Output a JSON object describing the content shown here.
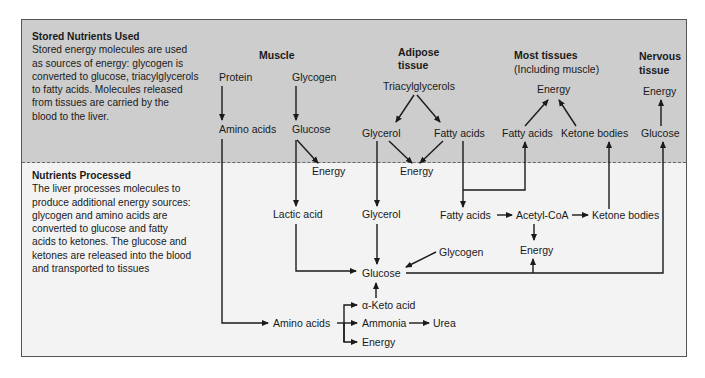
{
  "top_section": {
    "title": "Stored Nutrients Used",
    "lines": [
      "Stored energy molecules are used",
      "as sources of energy: glycogen is",
      "converted to glucose, triacylglycerols",
      "to fatty acids. Molecules released",
      "from tissues are carried by the",
      "blood to the liver."
    ]
  },
  "bottom_section": {
    "title": "Nutrients Processed",
    "lines": [
      "The liver processes molecules to",
      "produce additional energy sources:",
      "glycogen and amino acids are",
      "converted to glucose and fatty",
      "acids to ketones. The glucose and",
      "ketones are released into the blood",
      "and transported to tissues"
    ]
  },
  "tissues": {
    "muscle": "Muscle",
    "adipose": [
      "Adipose",
      "tissue"
    ],
    "most": [
      "Most tissues",
      "(Including muscle)"
    ],
    "nervous": [
      "Nervous",
      "tissue"
    ]
  },
  "nodes": {
    "protein": "Protein",
    "glycogen_muscle": "Glycogen",
    "amino_acids_muscle": "Amino acids",
    "glucose_muscle": "Glucose",
    "energy_muscle": "Energy",
    "triacylglycerols": "Triacylglycerols",
    "glycerol_adipose": "Glycerol",
    "fatty_acids_adipose": "Fatty acids",
    "energy_adipose": "Energy",
    "energy_most": "Energy",
    "fatty_acids_most": "Fatty acids",
    "ketone_bodies_most": "Ketone bodies",
    "energy_nervous": "Energy",
    "glucose_nervous": "Glucose",
    "lactic_acid": "Lactic acid",
    "glycerol_liver": "Glycerol",
    "fatty_acids_liver": "Fatty acids",
    "acetyl_coa": "Acetyl-CoA",
    "ketone_bodies_liver": "Ketone bodies",
    "glycogen_liver": "Glycogen",
    "energy_liver_acetyl": "Energy",
    "glucose_liver": "Glucose",
    "alpha_keto_acid": "α-Keto acid",
    "amino_acids_liver": "Amino acids",
    "ammonia": "Ammonia",
    "urea": "Urea",
    "energy_liver_amino": "Energy"
  },
  "colors": {
    "top_bg": "#cdcdcd",
    "bottom_bg": "#f3f3f3",
    "ink": "#1a1a1a"
  }
}
